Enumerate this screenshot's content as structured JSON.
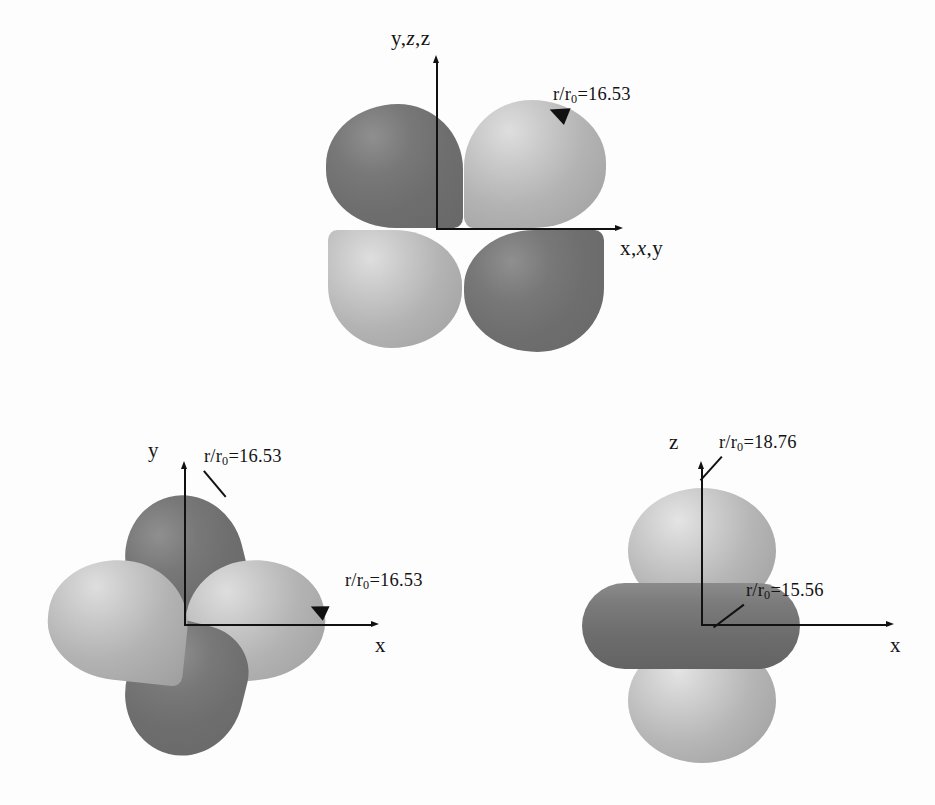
{
  "figure": {
    "type": "orbital-diagram",
    "background_color": "#fdfdfd",
    "lobe_dark_color": "#6e6e6e",
    "lobe_light_color": "#bdbdbd",
    "axis_color": "#111111"
  },
  "panels": {
    "top": {
      "name": "top-orbital",
      "vertical_axis_label": {
        "plain_1": "y,",
        "italic": "z",
        "plain_2": ",z"
      },
      "horizontal_axis_label": {
        "plain_1": "x,",
        "italic": "x",
        "plain_2": ",y"
      },
      "callout": {
        "prefix": "r/r",
        "sub": "0",
        "value": "=16.53"
      }
    },
    "bottom_left": {
      "name": "bottom-left-orbital",
      "vertical_axis_label": "y",
      "horizontal_axis_label": "x",
      "callout_vertical": {
        "prefix": "r/r",
        "sub": "0",
        "value": "=16.53"
      },
      "callout_horizontal": {
        "prefix": "r/r",
        "sub": "0",
        "value": "=16.53"
      }
    },
    "bottom_right": {
      "name": "bottom-right-orbital",
      "vertical_axis_label": "z",
      "horizontal_axis_label": "x",
      "callout_vertical": {
        "prefix": "r/r",
        "sub": "0",
        "value": "=18.76"
      },
      "callout_horizontal": {
        "prefix": "r/r",
        "sub": "0",
        "value": "=15.56"
      }
    }
  }
}
